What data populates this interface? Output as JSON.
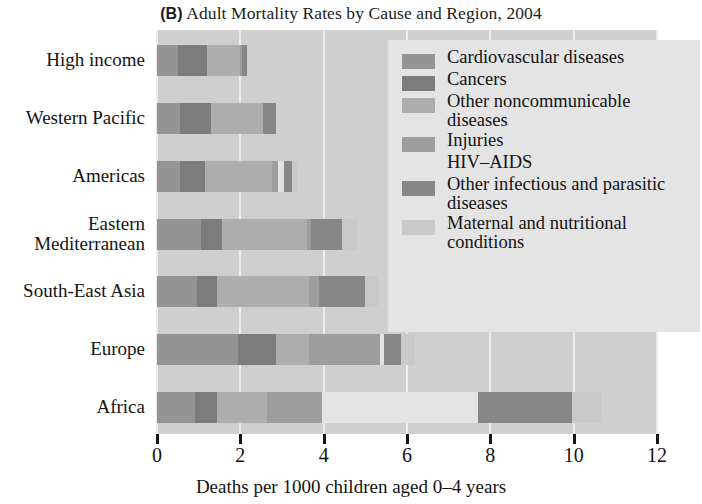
{
  "title": {
    "panel": "(B)",
    "text": "Adult Mortality Rates by Cause and Region, 2004",
    "full": "(B) Adult Mortality Rates by Cause and Region, 2004"
  },
  "colors": {
    "plot_background": "#cfcfcf",
    "legend_background": "#e4e4e4",
    "gridline": "#ededed",
    "axis": "#151515",
    "text": "#131313",
    "cardiovascular": "#949494",
    "cancers": "#7c7c7c",
    "other_noncommunicable": "#adadad",
    "injuries": "#9d9d9d",
    "hiv_aids": "#e3e3e3",
    "other_infectious": "#878787",
    "maternal_nutritional": "#c9c9c9"
  },
  "axis": {
    "x_title": "Deaths per 1000 children aged 0–4 years",
    "x_ticks": [
      "0",
      "2",
      "4",
      "6",
      "8",
      "10",
      "12"
    ],
    "x_min": 0,
    "x_max": 12
  },
  "legend": {
    "items": [
      {
        "label": "Cardiovascular diseases",
        "color": "#949494"
      },
      {
        "label": "Cancers",
        "color": "#7c7c7c"
      },
      {
        "label": "Other noncommunicable diseases",
        "color": "#adadad"
      },
      {
        "label": "Injuries",
        "color": "#9d9d9d"
      },
      {
        "label": "HIV–AIDS",
        "color": "#e3e3e3"
      },
      {
        "label": "Other infectious and parasitic diseases",
        "color": "#878787"
      },
      {
        "label": "Maternal and nutritional conditions",
        "color": "#c9c9c9"
      }
    ]
  },
  "chart_data": {
    "type": "bar",
    "orientation": "horizontal",
    "stacked": true,
    "title": "(B) Adult Mortality Rates by Cause and Region, 2004",
    "xlabel": "Deaths per 1000 children aged 0–4 years",
    "ylabel": "",
    "xlim": [
      0,
      12
    ],
    "xticks": [
      0,
      2,
      4,
      6,
      8,
      10,
      12
    ],
    "grid": true,
    "legend_position": "inside-top-right",
    "categories": [
      "High income",
      "Western Pacific",
      "Americas",
      "Eastern Mediterranean",
      "South-East Asia",
      "Europe",
      "Africa"
    ],
    "series": [
      {
        "name": "Cardiovascular diseases",
        "color": "#949494",
        "values": [
          0.5,
          0.55,
          0.55,
          1.05,
          0.95,
          1.95,
          0.9
        ]
      },
      {
        "name": "Cancers",
        "color": "#7c7c7c",
        "values": [
          0.7,
          0.75,
          0.6,
          0.5,
          0.5,
          0.9,
          0.55
        ]
      },
      {
        "name": "Other noncommunicable diseases",
        "color": "#adadad",
        "values": [
          0.8,
          1.25,
          1.6,
          2.05,
          2.2,
          0.8,
          1.2
        ]
      },
      {
        "name": "Injuries",
        "color": "#9d9d9d",
        "values": [
          0.05,
          0.0,
          0.15,
          0.1,
          0.25,
          1.7,
          1.3
        ]
      },
      {
        "name": "HIV–AIDS",
        "color": "#e3e3e3",
        "values": [
          0.0,
          0.0,
          0.15,
          0.0,
          0.0,
          0.1,
          3.75
        ]
      },
      {
        "name": "Other infectious and parasitic diseases",
        "color": "#878787",
        "values": [
          0.1,
          0.3,
          0.2,
          0.75,
          1.1,
          0.4,
          2.25
        ]
      },
      {
        "name": "Maternal and nutritional conditions",
        "color": "#c9c9c9",
        "values": [
          0.0,
          0.0,
          0.1,
          0.35,
          0.3,
          0.35,
          0.7
        ]
      }
    ],
    "totals": [
      2.15,
      2.85,
      3.35,
      4.8,
      5.3,
      6.2,
      10.65
    ]
  }
}
